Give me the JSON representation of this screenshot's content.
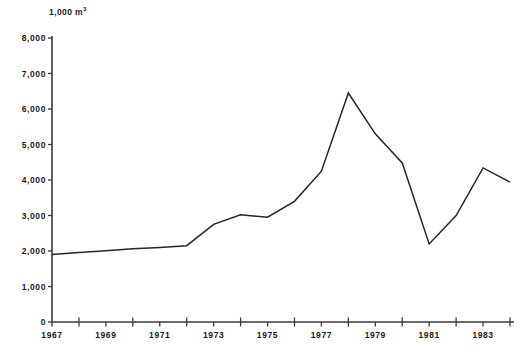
{
  "chart_data": {
    "type": "line",
    "title": "",
    "subtitle": "",
    "xlabel": "",
    "ylabel": "1,000 m3",
    "ylabel_display": "1,000 m",
    "ylabel_superscript": "3",
    "x": [
      1967,
      1968,
      1969,
      1970,
      1971,
      1972,
      1973,
      1974,
      1975,
      1976,
      1977,
      1978,
      1979,
      1980,
      1981,
      1982,
      1983,
      1984
    ],
    "values": [
      1900,
      1960,
      2010,
      2060,
      2100,
      2150,
      2750,
      3020,
      2950,
      3400,
      4250,
      6450,
      5300,
      4480,
      2200,
      3000,
      4340,
      3940
    ],
    "series": [
      {
        "name": "volume",
        "values": [
          1900,
          1960,
          2010,
          2060,
          2100,
          2150,
          2750,
          3020,
          2950,
          3400,
          4250,
          6450,
          5300,
          4480,
          2200,
          3000,
          4340,
          3940
        ]
      }
    ],
    "ylim": [
      0,
      8000
    ],
    "xlim": [
      1967,
      1984
    ],
    "y_ticks": [
      0,
      1000,
      2000,
      3000,
      4000,
      5000,
      6000,
      7000,
      8000
    ],
    "y_tick_labels": [
      "0",
      "1,000",
      "2,000",
      "3,000",
      "4,000",
      "5,000",
      "6,000",
      "7,000",
      "8,000"
    ],
    "x_ticks": [
      1967,
      1968,
      1969,
      1970,
      1971,
      1972,
      1973,
      1974,
      1975,
      1976,
      1977,
      1978,
      1979,
      1980,
      1981,
      1982,
      1983,
      1984
    ],
    "x_tick_labels_shown": [
      "1967",
      "1969",
      "1971",
      "1973",
      "1975",
      "1977",
      "1979",
      "1981",
      "1983"
    ],
    "x_labeled_years": [
      1967,
      1969,
      1971,
      1973,
      1975,
      1977,
      1979,
      1981,
      1983
    ],
    "grid": false,
    "legend": null,
    "legend_position": "none",
    "line_color": "#262626",
    "axis_color": "#3a3a3a",
    "background_color": "#ffffff"
  },
  "axes": {
    "y_labels": [
      {
        "text": "8,000",
        "value": 8000
      },
      {
        "text": "7,000",
        "value": 7000
      },
      {
        "text": "6,000",
        "value": 6000
      },
      {
        "text": "5,000",
        "value": 5000
      },
      {
        "text": "4,000",
        "value": 4000
      },
      {
        "text": "3,000",
        "value": 3000
      },
      {
        "text": "2,000",
        "value": 2000
      },
      {
        "text": "1,000",
        "value": 1000
      },
      {
        "text": "0",
        "value": 0
      }
    ],
    "x_labels": [
      {
        "text": "1967",
        "value": 1967
      },
      {
        "text": "1969",
        "value": 1969
      },
      {
        "text": "1971",
        "value": 1971
      },
      {
        "text": "1973",
        "value": 1973
      },
      {
        "text": "1975",
        "value": 1975
      },
      {
        "text": "1977",
        "value": 1977
      },
      {
        "text": "1979",
        "value": 1979
      },
      {
        "text": "1981",
        "value": 1981
      },
      {
        "text": "1983",
        "value": 1983
      }
    ],
    "unit_prefix": "1,000 m",
    "unit_exponent": "3"
  },
  "footer": {
    "cropped_caption": ""
  }
}
